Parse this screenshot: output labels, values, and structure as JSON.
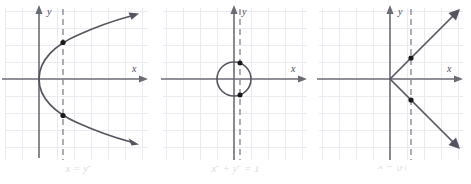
{
  "figure": {
    "name": "vertical-line-test-graphs",
    "colors": {
      "grid": "#e9e9ef",
      "axis": "#6b6b76",
      "curve": "#55555f",
      "dashed": "#8a8a94",
      "point": "#1a1a1a",
      "caption": "#dcdcdc",
      "background": "#ffffff"
    },
    "panels": [
      {
        "id": "panel-1",
        "caption": "x = y2",
        "caption_base": "x = y",
        "caption_exp": "2",
        "x_axis_label": "x",
        "y_axis_label": "y",
        "curve_type": "sideways-parabola",
        "vertex": [
          0,
          0
        ],
        "dashed_line_x": 2,
        "intersection_points": [
          [
            2,
            1.4
          ],
          [
            2,
            -1.4
          ]
        ],
        "grid_visible": true
      },
      {
        "id": "panel-2",
        "caption": "x2 + y2 = 1",
        "caption_parts": [
          "x",
          "2",
          " + ",
          "y",
          "2",
          " = 1"
        ],
        "x_axis_label": "x",
        "y_axis_label": "y",
        "curve_type": "circle",
        "center": [
          0,
          0
        ],
        "radius": 1,
        "dashed_line_x": 0.35,
        "intersection_points": [
          [
            0.35,
            0.94
          ],
          [
            0.35,
            -0.94
          ]
        ],
        "grid_visible": true
      },
      {
        "id": "panel-3",
        "caption": "x = |y|",
        "x_axis_label": "x",
        "y_axis_label": "y",
        "curve_type": "absolute-value-sideways",
        "vertex": [
          0,
          0
        ],
        "dashed_line_x": 1.2,
        "intersection_points": [
          [
            1.2,
            1.2
          ],
          [
            1.2,
            -1.2
          ]
        ],
        "grid_visible": true
      }
    ]
  },
  "chart_data": {
    "type": "line",
    "title": "",
    "xlabel": "x",
    "ylabel": "y",
    "grid": true,
    "panels": [
      {
        "title": "x = y2",
        "equation": "x = y^2",
        "xlim": [
          -2,
          7
        ],
        "ylim": [
          -4.5,
          4.5
        ],
        "series": [
          {
            "name": "x = y^2",
            "points_note": "rightward-opening parabola, vertex (0,0)"
          },
          {
            "name": "vertical test line",
            "x": 2,
            "style": "dashed"
          }
        ],
        "markers": [
          [
            2,
            1.4
          ],
          [
            2,
            -1.4
          ]
        ]
      },
      {
        "title": "x2 + y2 = 1",
        "equation": "x^2 + y^2 = 1",
        "xlim": [
          -4.5,
          4.5
        ],
        "ylim": [
          -4.5,
          4.5
        ],
        "series": [
          {
            "name": "unit circle",
            "center": [
              0,
              0
            ],
            "radius": 1
          },
          {
            "name": "vertical test line",
            "x": 0.35,
            "style": "dashed"
          }
        ],
        "markers": [
          [
            0.35,
            0.94
          ],
          [
            0.35,
            -0.94
          ]
        ]
      },
      {
        "title": "x = |y|",
        "equation": "x = |y|",
        "xlim": [
          -4.5,
          4.5
        ],
        "ylim": [
          -4.5,
          4.5
        ],
        "series": [
          {
            "name": "x = |y|",
            "points_note": "V opening rightward, vertex (0,0)"
          },
          {
            "name": "vertical test line",
            "x": 1.2,
            "style": "dashed"
          }
        ],
        "markers": [
          [
            1.2,
            1.2
          ],
          [
            1.2,
            -1.2
          ]
        ]
      }
    ]
  }
}
